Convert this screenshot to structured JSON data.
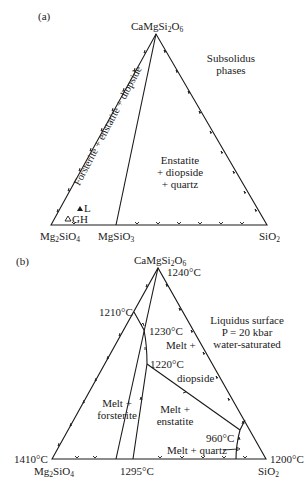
{
  "panel_a": {
    "label": "(a)",
    "apex": {
      "name": "CaMgSi",
      "sub1": "2",
      "mid": "O",
      "sub2": "6"
    },
    "left_corner": {
      "name": "Mg",
      "sub1": "2",
      "mid": "SiO",
      "sub2": "4"
    },
    "mid_point": {
      "name": "MgSiO",
      "sub1": "3"
    },
    "right_corner": {
      "name": "SiO",
      "sub1": "2"
    },
    "title_line1": "Subsolidus",
    "title_line2": "phases",
    "region_left": "Forsterite + enstatite + diopside",
    "region_right_line1": "Enstatite",
    "region_right_line2": "+ diopside",
    "region_right_line3": "+ quartz",
    "points": [
      {
        "symbol": "filled-triangle",
        "label": "L"
      },
      {
        "symbol": "open-triangle",
        "label": "GH"
      }
    ]
  },
  "panel_b": {
    "label": "(b)",
    "apex": {
      "name": "CaMgSi",
      "sub1": "2",
      "mid": "O",
      "sub2": "6"
    },
    "left_corner": {
      "name": "Mg",
      "sub1": "2",
      "mid": "SiO",
      "sub2": "4"
    },
    "right_corner": {
      "name": "SiO",
      "sub1": "2"
    },
    "temps": {
      "apex": "1240°C",
      "left_corner": "1410°C",
      "right_corner": "1200°C",
      "enstatite_base": "1295°C",
      "fo_di": "1210°C",
      "peritectic_upper": "1230°C",
      "peritectic": "1220°C",
      "eutectic": "960°C"
    },
    "title_line1": "Liquidus surface",
    "title_line2": "P = 20 kbar",
    "title_line3": "water-saturated",
    "fields": {
      "diopside_line1": "Melt +",
      "diopside_line2": "diopside",
      "forsterite_line1": "Melt +",
      "forsterite_line2": "forsterite",
      "enstatite_line1": "Melt +",
      "enstatite_line2": "enstatite",
      "quartz": "Melt + quartz"
    }
  }
}
